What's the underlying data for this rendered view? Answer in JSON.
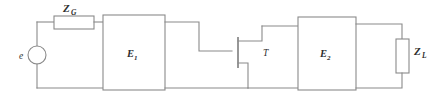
{
  "figure": {
    "kind": "circuit-schematic",
    "title": "",
    "width": 434,
    "height": 103,
    "background_color": "#ffffff",
    "line_color": "#8a8a8a",
    "text_color": "#2e2e2e"
  },
  "labels": {
    "source": "e",
    "generator_impedance": "Z",
    "generator_impedance_sub": "G",
    "network_one": "E",
    "network_one_sub": "1",
    "transistor": "T",
    "network_two": "E",
    "network_two_sub": "2",
    "load_impedance": "Z",
    "load_impedance_sub": "L"
  },
  "components": [
    {
      "name": "voltage-source",
      "symbol": "circle",
      "label": "e",
      "x": 37,
      "y": 55
    },
    {
      "name": "generator-impedance",
      "symbol": "resistor-box-horizontal",
      "label": "Z_G",
      "x": 54,
      "y": 16,
      "width": 40,
      "height": 13
    },
    {
      "name": "two-port-network-one",
      "symbol": "rectangle",
      "label": "E_1",
      "x": 103,
      "y": 15,
      "width": 62,
      "height": 75
    },
    {
      "name": "transistor",
      "symbol": "fet",
      "label": "T",
      "x": 238,
      "y": 52
    },
    {
      "name": "two-port-network-two",
      "symbol": "rectangle",
      "label": "E_2",
      "x": 298,
      "y": 17,
      "width": 58,
      "height": 73
    },
    {
      "name": "load-impedance",
      "symbol": "resistor-box-vertical",
      "label": "Z_L",
      "x": 396,
      "y": 39,
      "width": 13,
      "height": 34
    }
  ],
  "rails": {
    "top_y": 22,
    "bottom_y": 88,
    "left_x": 37,
    "right_x": 402
  }
}
